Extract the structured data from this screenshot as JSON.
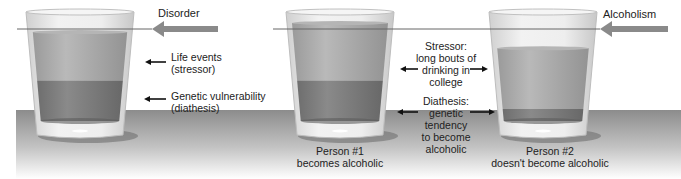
{
  "colors": {
    "table_top": "#8c8c8c",
    "table_bottom": "#ffffff",
    "glass": "#e6e6e6",
    "liquid_light": "#a8a8a8",
    "liquid_dark": "#7e7e7e",
    "threshold_arrow": "#8a8a8a",
    "threshold_line": "#666666",
    "text": "#222222"
  },
  "panel_left": {
    "threshold_label": "Disorder",
    "layers": [
      {
        "name": "Life events (stressor)",
        "label_lines": [
          "Life events",
          "(stressor)"
        ]
      },
      {
        "name": "Genetic vulnerability (diathesis)",
        "label_lines": [
          "Genetic vulnerability",
          "(diathesis)"
        ]
      }
    ],
    "fill_levels": {
      "total": 0.88,
      "diathesis": 0.4
    }
  },
  "panel_right": {
    "threshold_label": "Alcoholism",
    "stressor_label_lines": [
      "Stressor:",
      "long bouts of",
      "drinking in",
      "college"
    ],
    "diathesis_label_lines": [
      "Diathesis:",
      "genetic",
      "tendency",
      "to become",
      "alcoholic"
    ],
    "person1": {
      "caption_lines": [
        "Person #1",
        "becomes alcoholic"
      ],
      "fill_levels": {
        "total": 0.97,
        "diathesis": 0.4
      }
    },
    "person2": {
      "caption_lines": [
        "Person #2",
        "doesn't become alcoholic"
      ],
      "fill_levels": {
        "total": 0.72,
        "diathesis": 0.12
      }
    }
  }
}
